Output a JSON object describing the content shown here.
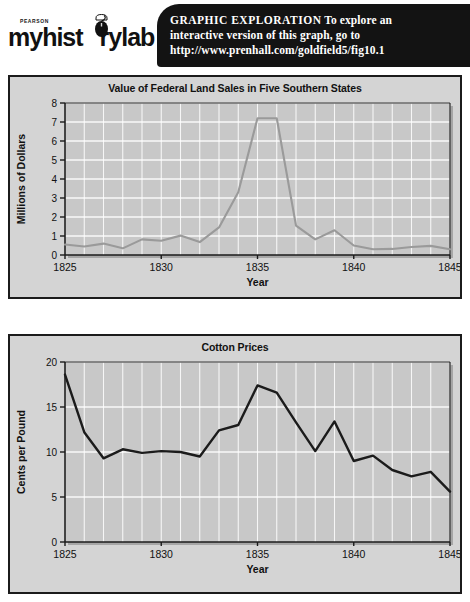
{
  "header": {
    "logo": {
      "brand": "PEARSON",
      "wordmark_pre": "myhist",
      "wordmark_post": "rylab",
      "mouse_icon_name": "computer-mouse-icon"
    },
    "banner": {
      "line1_caps": "GRAPHIC  EXPLORATION",
      "line1_rest": "  To explore an",
      "line2": "interactive version of this graph, go to",
      "line3": "http://www.prenhall.com/goldfield5/fig10.1",
      "background": "#131313",
      "text_color": "#ffffff"
    }
  },
  "figure": {
    "panel_background": "#d4d4d4",
    "panel_border": "#1b1b1b",
    "plot_background": "#c8c8c8",
    "gridline_color": "#ffffff"
  },
  "chart_data": [
    {
      "type": "line",
      "title": "Value of Federal Land Sales in Five Southern States",
      "xlabel": "Year",
      "ylabel": "Millions of Dollars",
      "xlim": [
        1825,
        1845
      ],
      "ylim": [
        0,
        8
      ],
      "yticks": [
        0,
        1,
        2,
        3,
        4,
        5,
        6,
        7,
        8
      ],
      "ytick_labels": [
        "0",
        "1",
        "2",
        "3",
        "4",
        "5",
        "6",
        "7",
        "8"
      ],
      "xticks": [
        1825,
        1830,
        1835,
        1840,
        1845
      ],
      "xtick_labels": [
        "1825",
        "1830",
        "1835",
        "1840",
        "1845"
      ],
      "grid": true,
      "line_color": "#9a9a9a",
      "x": [
        1825,
        1826,
        1827,
        1828,
        1829,
        1830,
        1831,
        1832,
        1833,
        1834,
        1835,
        1836,
        1837,
        1838,
        1839,
        1840,
        1841,
        1842,
        1843,
        1844,
        1845
      ],
      "values": [
        0.55,
        0.45,
        0.6,
        0.35,
        0.82,
        0.75,
        1.02,
        0.68,
        1.45,
        3.3,
        7.2,
        7.2,
        1.55,
        0.82,
        1.3,
        0.5,
        0.3,
        0.32,
        0.42,
        0.48,
        0.3
      ]
    },
    {
      "type": "line",
      "title": "Cotton Prices",
      "xlabel": "Year",
      "ylabel": "Cents per Pound",
      "xlim": [
        1825,
        1845
      ],
      "ylim": [
        0,
        20
      ],
      "yticks": [
        0,
        5,
        10,
        15,
        20
      ],
      "ytick_labels": [
        "0",
        "5",
        "10",
        "15",
        "20"
      ],
      "xticks": [
        1825,
        1830,
        1835,
        1840,
        1845
      ],
      "xtick_labels": [
        "1825",
        "1830",
        "1835",
        "1840",
        "1845"
      ],
      "grid": true,
      "line_color": "#1b1b1b",
      "x": [
        1825,
        1826,
        1827,
        1828,
        1829,
        1830,
        1831,
        1832,
        1833,
        1834,
        1835,
        1836,
        1837,
        1838,
        1839,
        1840,
        1841,
        1842,
        1843,
        1844,
        1845
      ],
      "values": [
        18.6,
        12.2,
        9.3,
        10.3,
        9.9,
        10.1,
        10.0,
        9.5,
        12.4,
        13.0,
        17.4,
        16.6,
        13.3,
        10.1,
        13.4,
        9.0,
        9.6,
        8.0,
        7.3,
        7.8,
        5.6
      ]
    }
  ]
}
